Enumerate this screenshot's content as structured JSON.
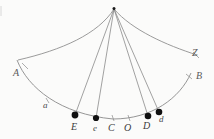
{
  "figure": {
    "background_color": "#fbfbfa",
    "stroke_color": "#8a8a8a",
    "dot_color": "#101010",
    "labels": {
      "apex": "",
      "left_curve_end": "A",
      "right_curve_end": "Z",
      "right_arc_tick": "B",
      "left_arc_tick": "a",
      "point_E": "E",
      "point_e": "e",
      "point_C": "C",
      "point_O": "O",
      "point_D": "D",
      "point_d": "d"
    },
    "points": [
      {
        "name": "E",
        "label": "E",
        "x": 75,
        "y": 115,
        "filled": true
      },
      {
        "name": "e",
        "label": "e",
        "x": 96,
        "y": 118,
        "filled": true
      },
      {
        "name": "C",
        "label": "C",
        "x": 113,
        "y": 119,
        "filled": false
      },
      {
        "name": "O",
        "label": "O",
        "x": 129,
        "y": 119,
        "filled": false
      },
      {
        "name": "D",
        "label": "D",
        "x": 148,
        "y": 116,
        "filled": true
      },
      {
        "name": "d",
        "label": "d",
        "x": 159,
        "y": 112,
        "filled": true
      }
    ],
    "vertices": [
      {
        "name": "apex",
        "x": 114,
        "y": 8
      },
      {
        "name": "A",
        "x": 17,
        "y": 60
      },
      {
        "name": "Z",
        "x": 197,
        "y": 55
      },
      {
        "name": "a",
        "x": 46,
        "y": 101
      },
      {
        "name": "B",
        "x": 190,
        "y": 72
      }
    ]
  }
}
